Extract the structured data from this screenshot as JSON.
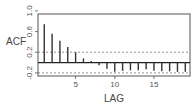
{
  "chart_data": {
    "type": "bar",
    "title": "",
    "xlabel": "LAG",
    "ylabel": "ACF",
    "x": [
      1,
      2,
      3,
      4,
      5,
      6,
      7,
      8,
      9,
      10,
      11,
      12,
      13,
      14,
      15,
      16,
      17,
      18,
      19
    ],
    "values": [
      0.74,
      0.56,
      0.42,
      0.3,
      0.2,
      0.08,
      0.03,
      -0.05,
      -0.12,
      -0.18,
      -0.16,
      -0.15,
      -0.15,
      -0.13,
      -0.16,
      -0.17,
      -0.17,
      -0.18,
      -0.18
    ],
    "confidence_bounds": [
      0.2,
      -0.2
    ],
    "xticks": [
      5,
      10,
      15
    ],
    "xtick_labels": [
      "5",
      "10",
      "15"
    ],
    "yticks": [
      1.0,
      0.6,
      0.2,
      -0.2
    ],
    "ytick_labels": [
      "1.0",
      "0.6",
      "0.2",
      "-0.2"
    ],
    "xlim": [
      0.2,
      19.6
    ],
    "ylim": [
      -0.26,
      0.94
    ],
    "grid": false,
    "legend": null
  },
  "labels": {
    "ylabel": "ACF",
    "xlabel": "LAG",
    "xticks": [
      "5",
      "10",
      "15"
    ],
    "yticks": [
      "1.0",
      "0.6",
      "0.2",
      "-0.2"
    ]
  },
  "colors": {
    "bars": "#333333",
    "frame": "#555555",
    "bounds": "#777777",
    "zero_line": "#222222"
  }
}
